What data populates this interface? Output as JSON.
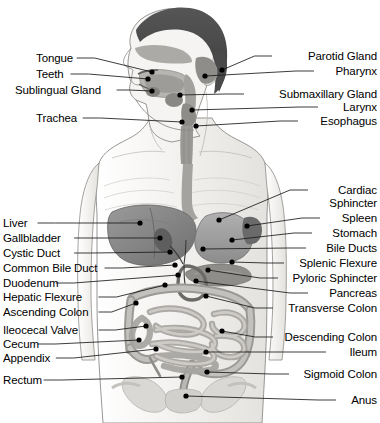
{
  "figure": {
    "background_color": "#ffffff",
    "width": 380,
    "height": 423,
    "line_color": "#1a1a1a",
    "dot_color": "#000000",
    "palette": {
      "hair": "#4a4a4a",
      "skin": "#f2f0ee",
      "outline": "#6e6e6e",
      "organ_dark": "#7e7e7e",
      "organ_mid": "#9d9d9d",
      "organ_light": "#c2c2c2",
      "intestine": "#b4b2ae",
      "bone": "#d9d7d3"
    }
  },
  "labels_left": [
    {
      "text": "Tongue",
      "x": 36,
      "y": 58,
      "line_to_x": 152,
      "line_to_y": 72,
      "dot_x": 152,
      "dot_y": 72
    },
    {
      "text": "Teeth",
      "x": 36,
      "y": 74,
      "line_to_x": 148,
      "line_to_y": 79,
      "dot_x": 148,
      "dot_y": 79
    },
    {
      "text": "Sublingual Gland",
      "x": 15,
      "y": 90,
      "line_to_x": 152,
      "line_to_y": 91,
      "dot_x": 152,
      "dot_y": 91
    },
    {
      "text": "Trachea",
      "x": 36,
      "y": 118,
      "line_to_x": 182,
      "line_to_y": 122,
      "dot_x": 182,
      "dot_y": 122
    },
    {
      "text": "Liver",
      "x": 3,
      "y": 223,
      "line_to_x": 140,
      "line_to_y": 223,
      "dot_x": 140,
      "dot_y": 223
    },
    {
      "text": "Gallbladder",
      "x": 3,
      "y": 238,
      "line_to_x": 160,
      "line_to_y": 238,
      "dot_x": 160,
      "dot_y": 238
    },
    {
      "text": "Cystic Duct",
      "x": 3,
      "y": 253,
      "line_to_x": 170,
      "line_to_y": 252,
      "dot_x": 170,
      "dot_y": 252
    },
    {
      "text": "Common Bile Duct",
      "x": 3,
      "y": 268,
      "line_to_x": 175,
      "line_to_y": 265,
      "dot_x": 175,
      "dot_y": 265
    },
    {
      "text": "Duodenum",
      "x": 3,
      "y": 283,
      "line_to_x": 178,
      "line_to_y": 275,
      "dot_x": 178,
      "dot_y": 275
    },
    {
      "text": "Hepatic Flexure",
      "x": 3,
      "y": 297,
      "line_to_x": 165,
      "line_to_y": 285,
      "dot_x": 165,
      "dot_y": 285
    },
    {
      "text": "Ascending Colon",
      "x": 3,
      "y": 312,
      "line_to_x": 136,
      "line_to_y": 303,
      "dot_x": 136,
      "dot_y": 303
    },
    {
      "text": "Ileocecal Valve",
      "x": 3,
      "y": 330,
      "line_to_x": 146,
      "line_to_y": 326,
      "dot_x": 146,
      "dot_y": 326
    },
    {
      "text": "Cecum",
      "x": 3,
      "y": 344,
      "line_to_x": 139,
      "line_to_y": 340,
      "dot_x": 139,
      "dot_y": 340
    },
    {
      "text": "Appendix",
      "x": 3,
      "y": 358,
      "line_to_x": 156,
      "line_to_y": 349,
      "dot_x": 156,
      "dot_y": 349
    },
    {
      "text": "Rectum",
      "x": 3,
      "y": 380,
      "line_to_x": 182,
      "line_to_y": 377,
      "dot_x": 182,
      "dot_y": 377
    }
  ],
  "labels_right": [
    {
      "text": "Parotid Gland",
      "x": 276,
      "y": 56,
      "line_to_x": 222,
      "line_to_y": 70,
      "dot_x": 222,
      "dot_y": 70
    },
    {
      "text": "Pharynx",
      "x": 318,
      "y": 71,
      "line_to_x": 205,
      "line_to_y": 76,
      "dot_x": 205,
      "dot_y": 76
    },
    {
      "text": "Submaxillary Gland",
      "x": 248,
      "y": 94,
      "line_to_x": 180,
      "line_to_y": 95,
      "dot_x": 180,
      "dot_y": 95
    },
    {
      "text": "Larynx",
      "x": 322,
      "y": 107,
      "line_to_x": 192,
      "line_to_y": 110,
      "dot_x": 192,
      "dot_y": 110
    },
    {
      "text": "Esophagus",
      "x": 302,
      "y": 121,
      "line_to_x": 196,
      "line_to_y": 126,
      "dot_x": 196,
      "dot_y": 126
    },
    {
      "text": "Cardiac Sphincter",
      "x": 312,
      "y": 190,
      "line_to_x": 219,
      "line_to_y": 220,
      "dot_x": 219,
      "dot_y": 220,
      "two_line": true
    },
    {
      "text": "Spleen",
      "x": 324,
      "y": 218,
      "line_to_x": 247,
      "line_to_y": 226,
      "dot_x": 247,
      "dot_y": 226
    },
    {
      "text": "Stomach",
      "x": 316,
      "y": 233,
      "line_to_x": 232,
      "line_to_y": 240,
      "dot_x": 232,
      "dot_y": 240
    },
    {
      "text": "Bile Ducts",
      "x": 310,
      "y": 248,
      "line_to_x": 203,
      "line_to_y": 249,
      "dot_x": 203,
      "dot_y": 249
    },
    {
      "text": "Splenic Flexure",
      "x": 288,
      "y": 263,
      "line_to_x": 232,
      "line_to_y": 262,
      "dot_x": 232,
      "dot_y": 262
    },
    {
      "text": "Pyloric Sphincter",
      "x": 282,
      "y": 278,
      "line_to_x": 208,
      "line_to_y": 270,
      "dot_x": 208,
      "dot_y": 270
    },
    {
      "text": "Pancreas",
      "x": 312,
      "y": 293,
      "line_to_x": 196,
      "line_to_y": 281,
      "dot_x": 196,
      "dot_y": 281
    },
    {
      "text": "Transverse Colon",
      "x": 277,
      "y": 308,
      "line_to_x": 206,
      "line_to_y": 296,
      "dot_x": 206,
      "dot_y": 296
    },
    {
      "text": "Descending Colon",
      "x": 277,
      "y": 337,
      "line_to_x": 222,
      "line_to_y": 331,
      "dot_x": 222,
      "dot_y": 331
    },
    {
      "text": "Ileum",
      "x": 330,
      "y": 352,
      "line_to_x": 206,
      "line_to_y": 352,
      "dot_x": 206,
      "dot_y": 352
    },
    {
      "text": "Sigmoid Colon",
      "x": 293,
      "y": 374,
      "line_to_x": 207,
      "line_to_y": 372,
      "dot_x": 207,
      "dot_y": 372
    },
    {
      "text": "Anus",
      "x": 340,
      "y": 400,
      "line_to_x": 186,
      "line_to_y": 396,
      "dot_x": 186,
      "dot_y": 396
    }
  ]
}
